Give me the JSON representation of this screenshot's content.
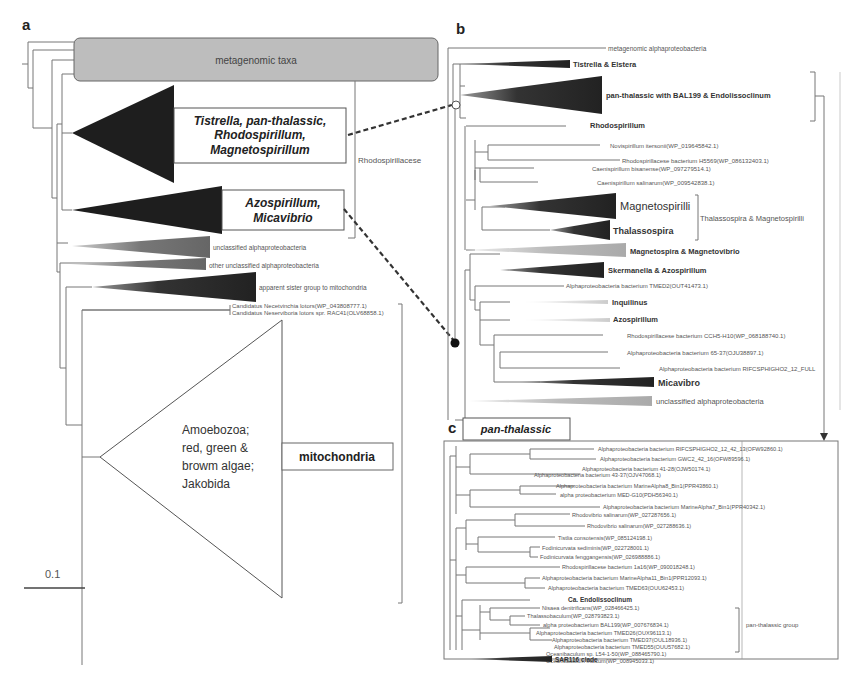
{
  "figure": {
    "panel_a": {
      "letter": "a",
      "metagenomic_box": "metagenomic taxa",
      "clade_group_1": [
        "Tistrella, pan-thalassic,",
        "Rhodospirillum,",
        "Magnetospirillum"
      ],
      "clade_group_2": [
        "Azospirillum,",
        "Micavibrio"
      ],
      "family_label": "Rhodospirillacese",
      "unclassified": "unclassified alphaproteobacteria",
      "other_unclassified": "other unclassified alphaproteobacteria",
      "sister_group": "apparent sister group to mitochondria",
      "candidatus_1": "Candidatus Necetvinchia lotors(WP_043808777.1)",
      "candidatus_2": "Candidatus Neserviboria lotors spr. RAC41(OLV68858.1)",
      "mito_clade_text": [
        "Amoebozoa;",
        "red, green &",
        "browm algae;",
        "Jakobida"
      ],
      "mito_label": "mitochondria",
      "scale_bar": "0.1"
    },
    "panel_b": {
      "letter": "b",
      "leaves": {
        "metagenomic": "metagenomic alphaproteobacteria",
        "tistrella": "Tistrella & Elstera",
        "panthal": "pan-thalassic with BAL199 & Endolissoclinum",
        "rhodospirillum": "Rhodospirillum",
        "novispirillum": "Novispirillum itersonii(WP_019645842.1)",
        "rhodo_h5569": "Rhodospirillacese bacterium H5569(WP_086132403.1)",
        "caenispirillum_b": "Caenispirillum bisanense(WP_097279514.1)",
        "caenispirillum_s": "Caenispirillum salinarum(WP_009542838.1)",
        "magnetospirilli": "Magnetospirilli",
        "thalassospira": "Thalassospira",
        "thal_mag_group": "Thalassospira & Magnetospirilli",
        "magnetospira": "Magnetospira & Magnetovibrio",
        "skermanella": "Skermanella & Azospirillum",
        "tmed2": "Alphaproteobacteria bacterium TMED2(OUT41473.1)",
        "inquilinus": "Inquilinus",
        "azospirillum": "Azospirillum",
        "cch5": "Rhodospirillacese bacterium CCH5-H10(WP_068188740.1)",
        "b6537": "Alphaproteobacteria bacterium 65-37(OJU38897.1)",
        "rifcs": "Alphaproteobacteria bacterium RIFCSPHIGHO2_12_FULL",
        "micavibrio": "Micavibro",
        "unclassified": "unclassified alphaproteobacteria"
      }
    },
    "panel_c": {
      "letter": "c",
      "title": "pan-thalassic",
      "group_label": "pan-thalassic group",
      "leaves": [
        "Alphaproteobacteria bacterium RIFCSPHIGHO2_12_42_13(OFW92860.1)",
        "Alphaproteobacteria bacterium GWC2_42_16(OFW89596.1)",
        "Alphaproteobacteria bacterium 41-28(OJW50174.1)",
        "Alphaproteobacteria bacterium 43-37(OJV47068.1)",
        "Alphaproteobacteria bacterium MarineAlpha8_Bin1(PPR43860.1)",
        "alpha proteobacterium MED-G10(PDH56340.1)",
        "Alphaproteobacteria bacterium MarineAlpha7_Bin1(PPR40342.1)",
        "Rhodovibrio salinarum(WP_027287656.1)",
        "Rhodovibrio salinarum(WP_027288636.1)",
        "Tistlia consotensis(WP_085124198.1)",
        "Fodinicurvata sediminis(WP_022728001.1)",
        "Fodinicurvata fenggangensis(WP_026988886.1)",
        "Rhodospirillacese bacterium 1a16(WP_090018248.1)",
        "Alphaproteobacteria bacterium MarineAlpha11_Bin1(PPR12093.1)",
        "Alphaproteobacteria bacterium TMED63(OUU62453.1)",
        "Ca. Endolissoclinum",
        "Nisaea denitrificans(WP_028466425.1)",
        "Thalassobaculum(WP_028793823.1)",
        "alpha proteobacterium BAL199(WP_007676834.1)",
        "Alphaproteobacteria bacterium TMED26(OUX96113.1)",
        "Alphaproteobacteria bacterium TMED37(OUL18936.1)",
        "Alphaproteobacteria bacterium TMED55(OUU57682.1)",
        "Oceanibaculum sp. L54-1-50(WP_088465790.1)",
        "Oceanibaculum indicum(WP_008945033.1)",
        "SAR116 clade"
      ]
    }
  }
}
